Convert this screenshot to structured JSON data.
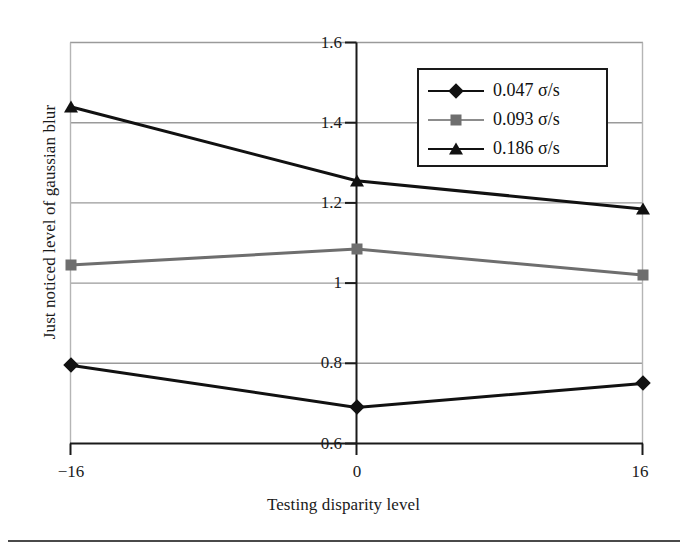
{
  "chart_data": {
    "type": "line",
    "title": "",
    "xlabel": "Testing disparity level",
    "ylabel": "Just noticed level of gaussian blur",
    "categories": [
      "-16",
      "0",
      "16"
    ],
    "x": [
      -16,
      0,
      16
    ],
    "xlim": [
      -16,
      16
    ],
    "ylim": [
      0.6,
      1.6
    ],
    "yticks": [
      "0.6",
      "0.8",
      "1",
      "1.2",
      "1.4",
      "1.6"
    ],
    "ytick_values": [
      0.6,
      0.8,
      1.0,
      1.2,
      1.4,
      1.6
    ],
    "xticks": [
      "-16",
      "0",
      "16"
    ],
    "grid": "horizontal",
    "legend_position": "top-right",
    "series": [
      {
        "name": "0.047 σ/s",
        "marker": "diamond",
        "color": "#111111",
        "values": [
          0.795,
          0.69,
          0.75
        ]
      },
      {
        "name": "0.093 σ/s",
        "marker": "square",
        "color": "#6e6e6e",
        "values": [
          1.045,
          1.085,
          1.02
        ]
      },
      {
        "name": "0.186 σ/s",
        "marker": "triangle",
        "color": "#111111",
        "values": [
          1.44,
          1.255,
          1.185
        ]
      }
    ]
  },
  "axis": {
    "x_title": "Testing disparity level",
    "y_title": "Just noticed level of gaussian blur",
    "y_labels": [
      "1.6",
      "1.4",
      "1.2",
      "1",
      "0.8",
      "0.6"
    ],
    "x_labels": [
      "−16",
      "0",
      "16"
    ]
  },
  "legend": {
    "items": [
      {
        "label": "0.047 σ/s",
        "marker": "diamond-marker",
        "color": "#111111"
      },
      {
        "label": "0.093 σ/s",
        "marker": "square-marker",
        "color": "#6e6e6e"
      },
      {
        "label": "0.186 σ/s",
        "marker": "triangle-marker",
        "color": "#111111"
      }
    ]
  },
  "colors": {
    "series_1": "#111111",
    "series_2": "#6e6e6e",
    "series_3": "#111111",
    "grid": "#9a9a9a",
    "axis": "#1a1a1a",
    "background": "#ffffff"
  }
}
